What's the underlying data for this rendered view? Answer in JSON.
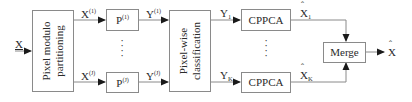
{
  "diagram": {
    "input": {
      "label": "X"
    },
    "blocks": {
      "partition": {
        "label_line1": "Pixel modulo",
        "label_line2": "partitioning"
      },
      "p_top": {
        "base": "P",
        "sup": "(1)"
      },
      "p_bottom": {
        "base": "P",
        "sup": "(J)"
      },
      "classification": {
        "label_line1": "Pixel-wise",
        "label_line2": "classification"
      },
      "cppca_top": {
        "label": "CPPCA"
      },
      "cppca_bottom": {
        "label": "CPPCA"
      },
      "merge": {
        "label": "Merge"
      }
    },
    "signals": {
      "x1": {
        "base": "X",
        "sup": "(1)"
      },
      "xJ": {
        "base": "X",
        "sup": "(J)"
      },
      "y1": {
        "base": "Y",
        "sup": "(1)"
      },
      "yJ": {
        "base": "Y",
        "sup": "(J)"
      },
      "Y1": {
        "base": "Y",
        "sub": "1"
      },
      "YK": {
        "base": "Y",
        "sub": "K"
      },
      "xhat1": {
        "base": "X",
        "sub": "1"
      },
      "xhatK": {
        "base": "X",
        "sub": "K"
      },
      "output": {
        "base": "X"
      }
    },
    "ellipsis": "⋮",
    "colors": {
      "stroke": "#8a8a8a",
      "text": "#2a2a2a",
      "arrow": "#1a1a1a",
      "background": "#ffffff"
    }
  }
}
